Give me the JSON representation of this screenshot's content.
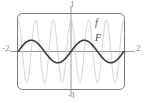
{
  "figure": {
    "width": 145,
    "height": 103,
    "background": "#ffffff"
  },
  "labels": {
    "x_min": "-2",
    "x_max": "2",
    "y_max": "1",
    "y_min": "-1",
    "curve_f": "f",
    "curve_F": "F"
  },
  "colors": {
    "frame": "#7a7a85",
    "axis": "#8b8b94",
    "curve_f": "#c9c9cf",
    "curve_F": "#3a3a3a",
    "label_axis": "#8f8f8f",
    "label_f": "#555555",
    "label_F": "#3a3a3a"
  },
  "chart_data": {
    "type": "line",
    "title": "",
    "xlabel": "",
    "ylabel": "",
    "xlim": [
      -2,
      2
    ],
    "ylim": [
      -1,
      1
    ],
    "grid": false,
    "legend": "inline-annotations",
    "xticks": [
      -2,
      2
    ],
    "yticks": [
      -1,
      1
    ],
    "xtick_labels": [
      "-2",
      "2"
    ],
    "ytick_labels": [
      "-1",
      "1"
    ],
    "annotations": [
      {
        "text": "f",
        "x": 0.75,
        "y": 0.62,
        "color": "#555555",
        "style": "italic"
      },
      {
        "text": "F",
        "x": 0.75,
        "y": 0.22,
        "color": "#3a3a3a",
        "style": "italic"
      }
    ],
    "series": [
      {
        "name": "f",
        "label": "f",
        "color": "#c9c9cf",
        "linewidth": 0.8,
        "description": "high-frequency oscillation, amplitude 0.85, about 6 full cycles across x in [-2,2]",
        "formula_hint": "f(x) = 0.85 * cos(3*pi*x)",
        "x": [
          -2.0,
          -1.9,
          -1.8,
          -1.7,
          -1.6,
          -1.5,
          -1.4,
          -1.3,
          -1.2,
          -1.1,
          -1.0,
          -0.9,
          -0.8,
          -0.7,
          -0.6,
          -0.5,
          -0.4,
          -0.3,
          -0.2,
          -0.1,
          0.0,
          0.1,
          0.2,
          0.3,
          0.4,
          0.5,
          0.6,
          0.7,
          0.8,
          0.9,
          1.0,
          1.1,
          1.2,
          1.3,
          1.4,
          1.5,
          1.6,
          1.7,
          1.8,
          1.9,
          2.0
        ],
        "y": [
          0.85,
          0.5,
          -0.26,
          -0.81,
          -0.69,
          0.0,
          0.69,
          0.81,
          0.26,
          -0.5,
          -0.85,
          -0.5,
          0.26,
          0.81,
          0.69,
          0.0,
          -0.69,
          -0.81,
          -0.26,
          0.5,
          0.85,
          0.5,
          -0.26,
          -0.81,
          -0.69,
          0.0,
          0.69,
          0.81,
          0.26,
          -0.5,
          -0.85,
          -0.5,
          0.26,
          0.81,
          0.69,
          0.0,
          -0.69,
          -0.81,
          -0.26,
          0.5,
          0.85
        ]
      },
      {
        "name": "F",
        "label": "F",
        "color": "#3a3a3a",
        "linewidth": 1.6,
        "description": "low-frequency antiderivative-like envelope, amplitude ~0.3, 2 full cycles across x in [-2,2]",
        "formula_hint": "F(x) = 0.30 * sin(pi*x)",
        "x": [
          -2.0,
          -1.9,
          -1.8,
          -1.7,
          -1.6,
          -1.5,
          -1.4,
          -1.3,
          -1.2,
          -1.1,
          -1.0,
          -0.9,
          -0.8,
          -0.7,
          -0.6,
          -0.5,
          -0.4,
          -0.3,
          -0.2,
          -0.1,
          0.0,
          0.1,
          0.2,
          0.3,
          0.4,
          0.5,
          0.6,
          0.7,
          0.8,
          0.9,
          1.0,
          1.1,
          1.2,
          1.3,
          1.4,
          1.5,
          1.6,
          1.7,
          1.8,
          1.9,
          2.0
        ],
        "y": [
          0.0,
          0.093,
          0.176,
          0.243,
          0.285,
          0.3,
          0.285,
          0.243,
          0.176,
          0.093,
          0.0,
          -0.093,
          -0.176,
          -0.243,
          -0.285,
          -0.3,
          -0.285,
          -0.243,
          -0.176,
          -0.093,
          0.0,
          0.093,
          0.176,
          0.243,
          0.285,
          0.3,
          0.285,
          0.243,
          0.176,
          0.093,
          0.0,
          -0.093,
          -0.176,
          -0.243,
          -0.285,
          -0.3,
          -0.285,
          -0.243,
          -0.176,
          -0.093,
          0.0
        ]
      }
    ]
  }
}
